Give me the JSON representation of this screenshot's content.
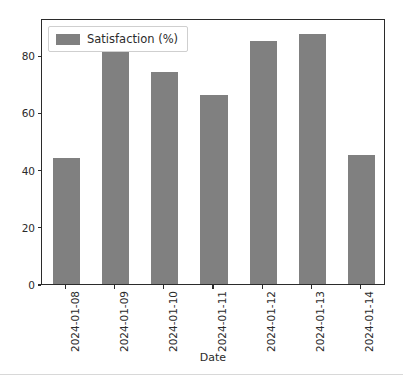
{
  "chart_data": {
    "type": "bar",
    "title": "",
    "subtitle": "",
    "xlabel": "Date",
    "ylabel": "",
    "categories": [
      "2024-01-08",
      "2024-01-09",
      "2024-01-10",
      "2024-01-11",
      "2024-01-12",
      "2024-01-13",
      "2024-01-14"
    ],
    "series": [
      {
        "name": "Satisfaction (%)",
        "values": [
          44,
          82,
          74,
          66,
          85,
          87.5,
          45
        ],
        "color": "#808080"
      }
    ],
    "values": [
      44,
      82,
      74,
      66,
      85,
      87.5,
      45
    ],
    "ylim": [
      0,
      93
    ],
    "yticks": [
      0,
      20,
      40,
      60,
      80
    ],
    "ytick_labels": [
      "0",
      "20",
      "40",
      "60",
      "80"
    ],
    "xtick_labels": [
      "2024-01-08",
      "2024-01-09",
      "2024-01-10",
      "2024-01-11",
      "2024-01-12",
      "2024-01-13",
      "2024-01-14"
    ],
    "grid": false,
    "legend": {
      "entries": [
        "Satisfaction (%)"
      ],
      "position": "upper left"
    },
    "annotations": []
  },
  "legend": {
    "label": "Satisfaction (%)",
    "swatch_color": "#808080",
    "swatch_icon": "legend-swatch-icon"
  },
  "axis": {
    "x_title": "Date",
    "y_title": "",
    "frame_color": "#2b2b2b",
    "tick_color": "#2b2b2b"
  }
}
